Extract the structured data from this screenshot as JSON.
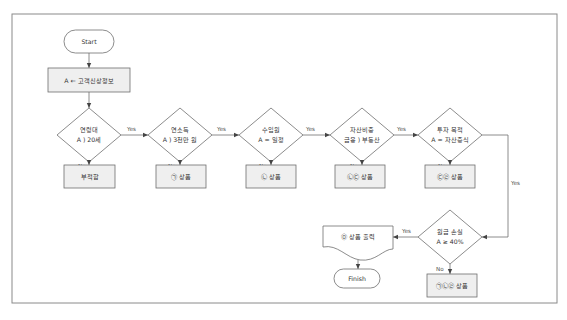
{
  "colors": {
    "frame": "#8a8a8a",
    "line": "#6e6e6e",
    "process_fill": "#efefef",
    "shape_fill": "#ffffff",
    "text": "#333333"
  },
  "flowchart": {
    "start": {
      "label": "Start"
    },
    "input": {
      "label": "A ← 고객신상정보"
    },
    "decisions": [
      {
        "line1": "연령대",
        "line2": "A ) 20세",
        "yes": "Yes",
        "no": "No",
        "result": "부적합"
      },
      {
        "line1": "연소득",
        "line2": "A ) 3천만 원",
        "yes": "Yes",
        "no": "No",
        "result": "㉠ 상품"
      },
      {
        "line1": "수입원",
        "line2": "A = 일정",
        "yes": "Yes",
        "no": "No",
        "result": "㉡ 상품"
      },
      {
        "line1": "자산비중",
        "line2": "금융 ) 부동산",
        "yes": "Yes",
        "no": "No",
        "result": "㉡㉢ 상품"
      },
      {
        "line1": "투자 목적",
        "line2": "A = 자산증식",
        "yes": "Yes",
        "no": "No",
        "result": "㉢㉣ 상품"
      },
      {
        "line1": "원금 손실",
        "line2": "A ≥ 40%",
        "yes": "Yes",
        "no": "No",
        "result": "㉠㉡㉣ 상품"
      }
    ],
    "output": {
      "label": "㉤ 상품 출력"
    },
    "finish": {
      "label": "Finish"
    }
  }
}
